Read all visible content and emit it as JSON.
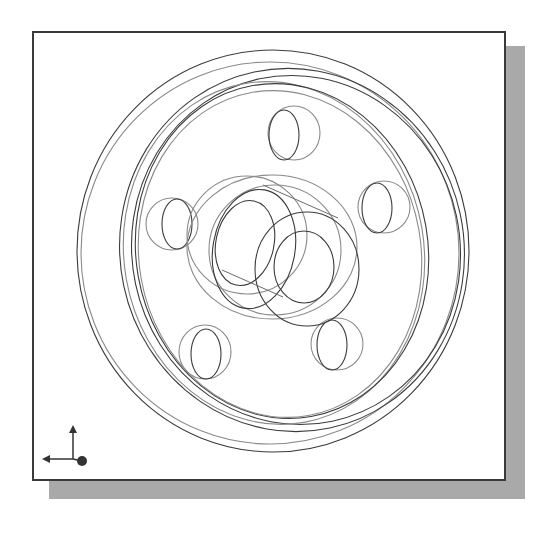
{
  "figure": {
    "view": "3D wireframe",
    "colors": {
      "frame": "#3a3a3a",
      "shadow": "#a9a9a9",
      "line_dark": "#3c3c3c",
      "line_light": "#8a8a8a",
      "background": "#ffffff"
    }
  },
  "drawing": {
    "rims": [
      {
        "name": "outer-rim-back",
        "cx": 273,
        "cy": 251,
        "rx": 196,
        "ry": 201,
        "rot": 0,
        "tone": "dark"
      },
      {
        "name": "outer-rim-back-2",
        "cx": 270,
        "cy": 253,
        "rx": 189,
        "ry": 191,
        "rot": 0,
        "tone": "light"
      },
      {
        "name": "outer-rim-front",
        "cx": 292,
        "cy": 250,
        "rx": 172,
        "ry": 182,
        "rot": -12,
        "tone": "dark"
      },
      {
        "name": "outer-rim-front-2",
        "cx": 296,
        "cy": 250,
        "rx": 164,
        "ry": 175,
        "rot": -12,
        "tone": "dark"
      },
      {
        "name": "inner-rim-1",
        "cx": 274,
        "cy": 253,
        "rx": 150,
        "ry": 172,
        "rot": -10,
        "tone": "light"
      },
      {
        "name": "inner-rim-2",
        "cx": 282,
        "cy": 251,
        "rx": 146,
        "ry": 168,
        "rot": -10,
        "tone": "dark"
      },
      {
        "name": "inner-rim-3",
        "cx": 280,
        "cy": 254,
        "rx": 141,
        "ry": 164,
        "rot": -10,
        "tone": "light"
      }
    ],
    "bolt_holes": [
      {
        "name": "bolt-hole-top",
        "outer": {
          "cx": 294,
          "cy": 133,
          "rx": 26,
          "ry": 27
        },
        "inner": {
          "cx": 284,
          "cy": 135,
          "rx": 15,
          "ry": 25
        }
      },
      {
        "name": "bolt-hole-right",
        "outer": {
          "cx": 384,
          "cy": 207,
          "rx": 26,
          "ry": 26
        },
        "inner": {
          "cx": 377,
          "cy": 208,
          "rx": 15,
          "ry": 25
        }
      },
      {
        "name": "bolt-hole-left",
        "outer": {
          "cx": 172,
          "cy": 224,
          "rx": 26,
          "ry": 26
        },
        "inner": {
          "cx": 177,
          "cy": 224,
          "rx": 15,
          "ry": 25
        }
      },
      {
        "name": "bolt-hole-bottom-left",
        "outer": {
          "cx": 205,
          "cy": 352,
          "rx": 26,
          "ry": 27
        },
        "inner": {
          "cx": 206,
          "cy": 354,
          "rx": 15,
          "ry": 25
        }
      },
      {
        "name": "bolt-hole-bottom-right",
        "outer": {
          "cx": 337,
          "cy": 344,
          "rx": 26,
          "ry": 26
        },
        "inner": {
          "cx": 332,
          "cy": 345,
          "rx": 15,
          "ry": 25
        }
      }
    ],
    "hub": [
      {
        "name": "hub-outer-back",
        "cx": 247,
        "cy": 235,
        "rx": 60,
        "ry": 59,
        "rot": 0,
        "tone": "light"
      },
      {
        "name": "hub-flange-back",
        "cx": 272,
        "cy": 247,
        "rx": 85,
        "ry": 72,
        "rot": 0,
        "tone": "light"
      },
      {
        "name": "hub-flange-mid",
        "cx": 275,
        "cy": 250,
        "rx": 66,
        "ry": 65,
        "rot": 0,
        "tone": "light"
      },
      {
        "name": "hub-bore-back",
        "cx": 245,
        "cy": 243,
        "rx": 29,
        "ry": 43,
        "rot": 12,
        "tone": "dark"
      },
      {
        "name": "hub-outer-front",
        "cx": 307,
        "cy": 269,
        "rx": 52,
        "ry": 57,
        "rot": 0,
        "tone": "dark"
      },
      {
        "name": "hub-bore-front",
        "cx": 304,
        "cy": 267,
        "rx": 30,
        "ry": 36,
        "rot": 0,
        "tone": "dark"
      },
      {
        "name": "hub-ring",
        "cx": 254,
        "cy": 249,
        "rx": 41,
        "ry": 60,
        "rot": 10,
        "tone": "dark"
      }
    ],
    "hub_lines": [
      {
        "name": "hub-tangent-top",
        "x1": 263,
        "y1": 185,
        "x2": 338,
        "y2": 218
      },
      {
        "name": "hub-tangent-bottom",
        "x1": 222,
        "y1": 270,
        "x2": 283,
        "y2": 297
      }
    ]
  },
  "axis_icon": {
    "name": "ucs-axis-icon",
    "origin": {
      "x": 73,
      "y": 459
    },
    "up_tip": {
      "x": 73,
      "y": 425
    },
    "left_tip": {
      "x": 42,
      "y": 459
    },
    "dot": {
      "x": 82,
      "y": 461,
      "r": 5
    }
  }
}
